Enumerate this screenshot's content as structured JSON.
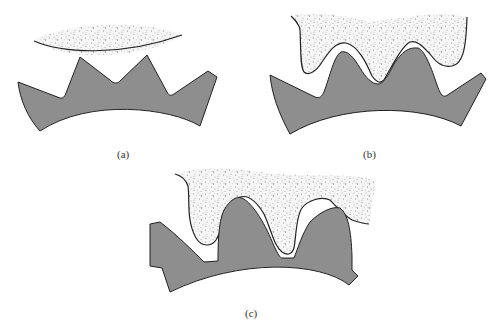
{
  "figure": {
    "panels": [
      {
        "id": "a",
        "label": "(a)",
        "description": "Grinding wheel contacting gear tooth tips"
      },
      {
        "id": "b",
        "label": "(b)",
        "description": "Form grinding wheel fitted between gear teeth"
      },
      {
        "id": "c",
        "label": "(c)",
        "description": "Shaped wheel engaging gear tooth flanks"
      }
    ],
    "colors": {
      "gear_fill": "#8e8e8e",
      "outline": "#222222",
      "wheel_fill": "#f4f4f4",
      "wheel_speckle": "#9a9a9a",
      "background": "#ffffff"
    }
  }
}
